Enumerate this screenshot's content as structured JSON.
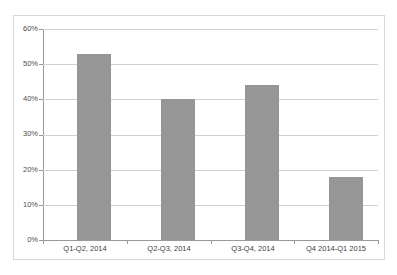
{
  "chart_data": {
    "type": "bar",
    "title": "",
    "subtitle": "",
    "xlabel": "",
    "ylabel": "",
    "categories": [
      "Q1-Q2, 2014",
      "Q2-Q3, 2014",
      "Q3-Q4, 2014",
      "Q4 2014-Q1 2015"
    ],
    "values": [
      53,
      40,
      44,
      18
    ],
    "value_suffix": "%",
    "ylim": [
      0,
      60
    ],
    "ytick_step": 10,
    "ytick_labels": [
      "0%",
      "10%",
      "20%",
      "30%",
      "40%",
      "50%",
      "60%"
    ],
    "ytick_values": [
      0,
      10,
      20,
      30,
      40,
      50,
      60
    ],
    "grid": true,
    "grid_axis": "y",
    "legend": false,
    "legend_position": "none",
    "series": [
      {
        "name": "",
        "values": [
          53,
          40,
          44,
          18
        ]
      }
    ],
    "colors": {
      "bar": "#969696",
      "gridline": "#d0d0d0",
      "axis": "#9a9a9a",
      "border": "#d9d9d9",
      "tick_text": "#4d4d4d",
      "background": "#ffffff"
    }
  }
}
